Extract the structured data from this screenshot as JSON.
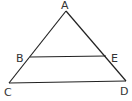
{
  "diagram": {
    "type": "geometry-triangle",
    "points": {
      "A": {
        "label": "A",
        "x": 66,
        "y": 11
      },
      "B": {
        "label": "B",
        "x": 30,
        "y": 57
      },
      "C": {
        "label": "C",
        "x": 9,
        "y": 83
      },
      "D": {
        "label": "D",
        "x": 126,
        "y": 81
      },
      "E": {
        "label": "E",
        "x": 106,
        "y": 56
      }
    },
    "segments": [
      "AC",
      "AD",
      "CD",
      "BE"
    ],
    "line_color": "#222222"
  }
}
